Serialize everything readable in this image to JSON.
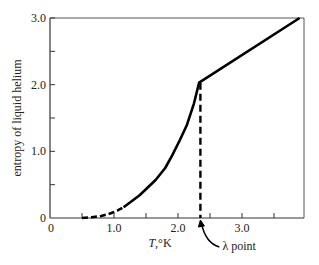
{
  "chart_data": {
    "type": "line",
    "title": "",
    "xlabel_italic": "T",
    "xlabel_rest": ",°K",
    "ylabel": "entropy of liquid helium",
    "xlim": [
      0,
      4.0
    ],
    "ylim": [
      0,
      3.0
    ],
    "grid": false,
    "x_ticks": [
      0.5,
      1.0,
      1.5,
      2.0,
      2.5,
      3.0,
      3.5
    ],
    "x_tick_labels": [
      {
        "value": 0,
        "label": "0"
      },
      {
        "value": 1.0,
        "label": "1.0"
      },
      {
        "value": 2.0,
        "label": "2.0"
      },
      {
        "value": 3.0,
        "label": "3.0"
      }
    ],
    "y_ticks": [
      0.5,
      1.0,
      1.5,
      2.0,
      2.5,
      3.0
    ],
    "y_tick_labels": [
      {
        "value": 0,
        "label": "0"
      },
      {
        "value": 1.0,
        "label": "1.0"
      },
      {
        "value": 2.0,
        "label": "2.0"
      },
      {
        "value": 3.0,
        "label": "3.0"
      }
    ],
    "series": [
      {
        "name": "extrapolated (dashed)",
        "style": "dashed",
        "x": [
          0.5,
          0.65,
          0.8,
          0.95,
          1.05,
          1.15
        ],
        "y": [
          0.0,
          0.01,
          0.03,
          0.07,
          0.11,
          0.16
        ]
      },
      {
        "name": "measured entropy",
        "style": "solid",
        "x": [
          1.15,
          1.4,
          1.65,
          1.8,
          1.91,
          2.03,
          2.14,
          2.25,
          2.33,
          3.9
        ],
        "y": [
          0.16,
          0.34,
          0.57,
          0.75,
          0.94,
          1.17,
          1.4,
          1.72,
          2.03,
          3.0
        ]
      }
    ],
    "annotations": [
      {
        "type": "vertical-dashed-line",
        "x": 2.35,
        "y_from": 0,
        "y_to": 2.03
      },
      {
        "type": "arrow-label",
        "text": "λ point",
        "points_to_x": 2.35
      }
    ]
  }
}
